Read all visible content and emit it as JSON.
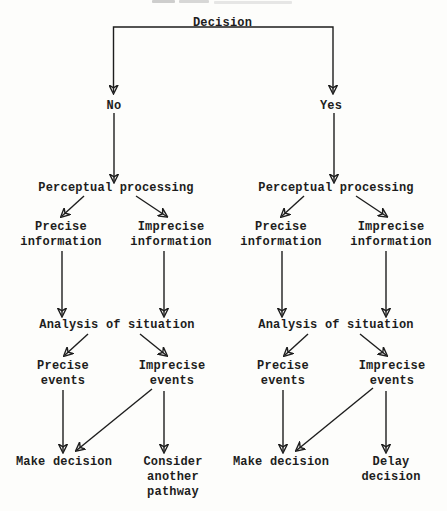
{
  "diagram": {
    "root": "Decision",
    "left": {
      "condition": "No",
      "perceptual": "Perceptual processing",
      "precise_information": "Precise\ninformation",
      "imprecise_information": "Imprecise\ninformation",
      "analysis": "Analysis of situation",
      "precise_events": "Precise\nevents",
      "imprecise_events": "Imprecise\nevents",
      "make_decision": "Make decision",
      "alternate_outcome": "Consider\nanother\npathway"
    },
    "right": {
      "condition": "Yes",
      "perceptual": "Perceptual processing",
      "precise_information": "Precise\ninformation",
      "imprecise_information": "Imprecise\ninformation",
      "analysis": "Analysis of situation",
      "precise_events": "Precise\nevents",
      "imprecise_events": "Imprecise\nevents",
      "make_decision": "Make decision",
      "alternate_outcome": "Delay\ndecision"
    },
    "colors": {
      "ink": "#1d1d1d",
      "background": "#fdfdfb"
    }
  }
}
